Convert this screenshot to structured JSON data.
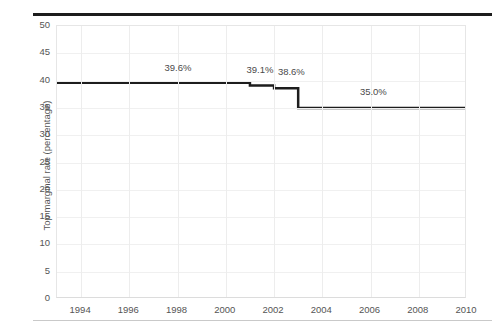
{
  "chart_data": {
    "type": "line",
    "subtype": "step",
    "title": "",
    "xlabel": "",
    "ylabel": "Top marginal rate (percentage)",
    "xlim": [
      1993,
      2010
    ],
    "ylim": [
      0,
      50
    ],
    "grid": true,
    "legend": "none",
    "x_ticks": [
      "1994",
      "1996",
      "1998",
      "2000",
      "2002",
      "2004",
      "2006",
      "2008",
      "2010"
    ],
    "x_tick_values": [
      1994,
      1996,
      1998,
      2000,
      2002,
      2004,
      2006,
      2008,
      2010
    ],
    "y_ticks": [
      "0",
      "5",
      "10",
      "15",
      "20",
      "25",
      "30",
      "35",
      "40",
      "45",
      "50"
    ],
    "y_tick_values": [
      0,
      5,
      10,
      15,
      20,
      25,
      30,
      35,
      40,
      45,
      50
    ],
    "series": [
      {
        "name": "Top marginal rate",
        "color": "#1d1d1d",
        "steps": [
          {
            "x_start": 1993,
            "x_end": 2001,
            "value": 39.6
          },
          {
            "x_start": 2001,
            "x_end": 2002,
            "value": 39.1
          },
          {
            "x_start": 2002,
            "x_end": 2003,
            "value": 38.6
          },
          {
            "x_start": 2003,
            "x_end": 2010,
            "value": 35.0
          }
        ]
      }
    ],
    "annotations": [
      {
        "text": "39.6%",
        "x": 1997.5,
        "y": 41.9
      },
      {
        "text": "39.1%",
        "x": 2000.9,
        "y": 41.6
      },
      {
        "text": "38.6%",
        "x": 2002.2,
        "y": 41.2
      },
      {
        "text": "35.0%",
        "x": 2005.6,
        "y": 37.6
      }
    ],
    "colors": {
      "line": "#1d1d1d",
      "grid": "#ededed",
      "axis_text": "#555555",
      "top_rule": "#1d1d1d",
      "bottom_rule": "#c9c9c9",
      "background": "#ffffff"
    }
  }
}
